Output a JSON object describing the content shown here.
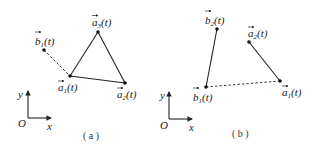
{
  "figure": {
    "panels": [
      {
        "id": "a",
        "caption": "( a )",
        "axes": {
          "origin": "O",
          "x": "x",
          "y": "y"
        },
        "points": [
          {
            "name": "a3",
            "base": "a",
            "sub": "3",
            "arg": "(t)"
          },
          {
            "name": "b1",
            "base": "b",
            "sub": "1",
            "arg": "(t)"
          },
          {
            "name": "a1",
            "base": "a",
            "sub": "1",
            "arg": "(t)"
          },
          {
            "name": "a2",
            "base": "a",
            "sub": "2",
            "arg": "(t)"
          }
        ],
        "edges": [
          {
            "from": "a1",
            "to": "a3",
            "style": "solid"
          },
          {
            "from": "a3",
            "to": "a2",
            "style": "solid"
          },
          {
            "from": "a1",
            "to": "a2",
            "style": "solid"
          },
          {
            "from": "b1",
            "to": "a1",
            "style": "dashed"
          }
        ]
      },
      {
        "id": "b",
        "caption": "( b )",
        "axes": {
          "origin": "O",
          "x": "x",
          "y": "y"
        },
        "points": [
          {
            "name": "b2",
            "base": "b",
            "sub": "2",
            "arg": "(t)"
          },
          {
            "name": "a2",
            "base": "a",
            "sub": "2",
            "arg": "(t)"
          },
          {
            "name": "b1",
            "base": "b",
            "sub": "1",
            "arg": "(t)"
          },
          {
            "name": "a1",
            "base": "a",
            "sub": "1",
            "arg": "(t)"
          }
        ],
        "edges": [
          {
            "from": "b1",
            "to": "b2",
            "style": "solid"
          },
          {
            "from": "a2",
            "to": "a1",
            "style": "solid"
          },
          {
            "from": "b1",
            "to": "a1",
            "style": "dashed"
          }
        ]
      }
    ]
  }
}
